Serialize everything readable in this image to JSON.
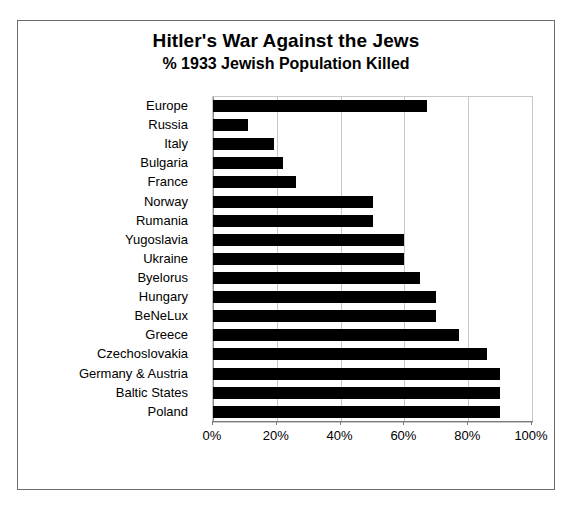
{
  "chart_data": {
    "type": "bar",
    "orientation": "horizontal",
    "title": "Hitler's War Against the Jews",
    "subtitle": "% 1933 Jewish Population Killed",
    "xlabel": "",
    "ylabel": "",
    "xlim": [
      0,
      100
    ],
    "xticks": [
      "0%",
      "20%",
      "40%",
      "60%",
      "80%",
      "100%"
    ],
    "xtick_values": [
      0,
      20,
      40,
      60,
      80,
      100
    ],
    "grid": true,
    "legend": "none",
    "bar_color": "#000000",
    "categories": [
      "Europe",
      "Russia",
      "Italy",
      "Bulgaria",
      "France",
      "Norway",
      "Rumania",
      "Yugoslavia",
      "Ukraine",
      "Byelorus",
      "Hungary",
      "BeNeLux",
      "Greece",
      "Czechoslovakia",
      "Germany & Austria",
      "Baltic States",
      "Poland"
    ],
    "values": [
      67,
      11,
      19,
      22,
      26,
      50,
      50,
      60,
      60,
      65,
      70,
      70,
      77,
      86,
      90,
      90,
      90
    ]
  }
}
